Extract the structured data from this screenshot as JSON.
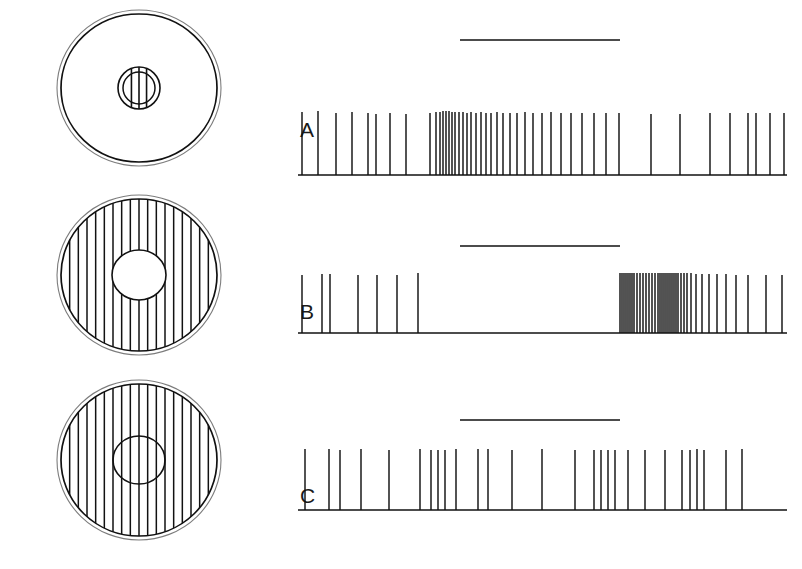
{
  "figure": {
    "background_color": "#ffffff",
    "ink_color": "#111111",
    "width": 802,
    "height": 569
  },
  "rows": [
    {
      "label": "A",
      "label_x": 300,
      "label_y": 118,
      "stimulus": {
        "name": "center-grating-only",
        "description": "Large blank outer circle with small concentric inner disc filled with vertical grating bars",
        "outer_circle": {
          "cx": 105,
          "cy": 88,
          "rx": 78,
          "ry": 74,
          "filled_with_grating": false
        },
        "annulus_ring": {
          "cx": 105,
          "cy": 88,
          "rx": 82,
          "ry": 78,
          "present": true
        },
        "inner_circle": {
          "cx": 105,
          "cy": 88,
          "rx": 21,
          "ry": 21,
          "filled_with_grating": true
        },
        "inner_ring": {
          "cx": 105,
          "cy": 88,
          "rx": 16,
          "ry": 16,
          "present": true
        },
        "grating_orientation": "vertical",
        "inner_bar_count": 3
      },
      "trace": {
        "name": "spike-train-a",
        "response_type": "excitation",
        "baseline_y": 155,
        "axis_x_start": 8,
        "axis_x_end": 497,
        "stimulus_bar": {
          "x_start": 170,
          "x_end": 330,
          "y": 20
        },
        "spike_height_default": 62,
        "spikes": [
          {
            "x": 12,
            "h": 63
          },
          {
            "x": 28,
            "h": 64
          },
          {
            "x": 46,
            "h": 62
          },
          {
            "x": 62,
            "h": 63
          },
          {
            "x": 78,
            "h": 62
          },
          {
            "x": 86,
            "h": 61
          },
          {
            "x": 100,
            "h": 62
          },
          {
            "x": 116,
            "h": 61
          },
          {
            "x": 140,
            "h": 62
          },
          {
            "x": 146,
            "h": 63
          },
          {
            "x": 150,
            "h": 63
          },
          {
            "x": 153,
            "h": 64
          },
          {
            "x": 156,
            "h": 64
          },
          {
            "x": 159,
            "h": 64
          },
          {
            "x": 162,
            "h": 63
          },
          {
            "x": 165,
            "h": 63
          },
          {
            "x": 169,
            "h": 63
          },
          {
            "x": 173,
            "h": 63
          },
          {
            "x": 177,
            "h": 62
          },
          {
            "x": 181,
            "h": 63
          },
          {
            "x": 186,
            "h": 62
          },
          {
            "x": 191,
            "h": 63
          },
          {
            "x": 196,
            "h": 62
          },
          {
            "x": 201,
            "h": 62
          },
          {
            "x": 207,
            "h": 63
          },
          {
            "x": 213,
            "h": 62
          },
          {
            "x": 220,
            "h": 62
          },
          {
            "x": 227,
            "h": 62
          },
          {
            "x": 235,
            "h": 63
          },
          {
            "x": 243,
            "h": 62
          },
          {
            "x": 252,
            "h": 62
          },
          {
            "x": 261,
            "h": 63
          },
          {
            "x": 271,
            "h": 62
          },
          {
            "x": 281,
            "h": 62
          },
          {
            "x": 292,
            "h": 62
          },
          {
            "x": 304,
            "h": 62
          },
          {
            "x": 316,
            "h": 62
          },
          {
            "x": 329,
            "h": 62
          },
          {
            "x": 361,
            "h": 61
          },
          {
            "x": 390,
            "h": 61
          },
          {
            "x": 420,
            "h": 62
          },
          {
            "x": 440,
            "h": 62
          },
          {
            "x": 458,
            "h": 62
          },
          {
            "x": 466,
            "h": 62
          },
          {
            "x": 480,
            "h": 62
          },
          {
            "x": 494,
            "h": 62
          }
        ]
      }
    },
    {
      "label": "B",
      "label_x": 300,
      "label_y": 300,
      "stimulus": {
        "name": "surround-grating-blank-center",
        "description": "Large circle filled with vertical grating bars, blank (unfilled) inner disc",
        "outer_circle": {
          "cx": 105,
          "cy": 90,
          "rx": 78,
          "ry": 76,
          "filled_with_grating": true
        },
        "annulus_ring": {
          "cx": 105,
          "cy": 90,
          "rx": 82,
          "ry": 80,
          "present": true
        },
        "inner_circle": {
          "cx": 105,
          "cy": 90,
          "rx": 27,
          "ry": 25,
          "filled_with_grating": false
        },
        "inner_ring": {
          "cx": 105,
          "cy": 90,
          "rx": 27,
          "ry": 25,
          "present": true
        },
        "grating_orientation": "vertical",
        "outer_bar_count": 17
      },
      "trace": {
        "name": "spike-train-b",
        "response_type": "suppression-with-offset-rebound",
        "baseline_y": 105,
        "axis_x_start": 8,
        "axis_x_end": 497,
        "stimulus_bar": {
          "x_start": 170,
          "x_end": 330,
          "y": 18
        },
        "spike_height_default": 58,
        "spikes": [
          {
            "x": 12,
            "h": 58
          },
          {
            "x": 32,
            "h": 59
          },
          {
            "x": 40,
            "h": 59
          },
          {
            "x": 68,
            "h": 58
          },
          {
            "x": 87,
            "h": 58
          },
          {
            "x": 107,
            "h": 58
          },
          {
            "x": 128,
            "h": 60
          },
          {
            "x": 330,
            "h": 60
          },
          {
            "x": 332,
            "h": 60
          },
          {
            "x": 334,
            "h": 60
          },
          {
            "x": 336,
            "h": 60
          },
          {
            "x": 338,
            "h": 60
          },
          {
            "x": 340,
            "h": 60
          },
          {
            "x": 342,
            "h": 60
          },
          {
            "x": 344,
            "h": 60
          },
          {
            "x": 347,
            "h": 60
          },
          {
            "x": 350,
            "h": 60
          },
          {
            "x": 353,
            "h": 60
          },
          {
            "x": 356,
            "h": 60
          },
          {
            "x": 359,
            "h": 60
          },
          {
            "x": 362,
            "h": 60
          },
          {
            "x": 365,
            "h": 60
          },
          {
            "x": 368,
            "h": 60
          },
          {
            "x": 370,
            "h": 60
          },
          {
            "x": 372,
            "h": 60
          },
          {
            "x": 374,
            "h": 60
          },
          {
            "x": 376,
            "h": 60
          },
          {
            "x": 378,
            "h": 60
          },
          {
            "x": 380,
            "h": 60
          },
          {
            "x": 382,
            "h": 60
          },
          {
            "x": 384,
            "h": 60
          },
          {
            "x": 386,
            "h": 60
          },
          {
            "x": 388,
            "h": 60
          },
          {
            "x": 391,
            "h": 60
          },
          {
            "x": 394,
            "h": 60
          },
          {
            "x": 397,
            "h": 60
          },
          {
            "x": 401,
            "h": 60
          },
          {
            "x": 406,
            "h": 59
          },
          {
            "x": 412,
            "h": 59
          },
          {
            "x": 419,
            "h": 59
          },
          {
            "x": 427,
            "h": 59
          },
          {
            "x": 436,
            "h": 59
          },
          {
            "x": 446,
            "h": 58
          },
          {
            "x": 458,
            "h": 58
          },
          {
            "x": 476,
            "h": 58
          },
          {
            "x": 492,
            "h": 58
          }
        ]
      }
    },
    {
      "label": "C",
      "label_x": 300,
      "label_y": 484,
      "stimulus": {
        "name": "full-field-grating",
        "description": "Large circle filled with vertical grating bars continuing through the outlined inner disc",
        "outer_circle": {
          "cx": 105,
          "cy": 88,
          "rx": 78,
          "ry": 76,
          "filled_with_grating": true
        },
        "annulus_ring": {
          "cx": 105,
          "cy": 88,
          "rx": 82,
          "ry": 80,
          "present": true
        },
        "inner_circle": {
          "cx": 105,
          "cy": 88,
          "rx": 26,
          "ry": 24,
          "filled_with_grating": true
        },
        "inner_ring": {
          "cx": 105,
          "cy": 88,
          "rx": 26,
          "ry": 24,
          "present": true
        },
        "grating_orientation": "vertical",
        "outer_bar_count": 17
      },
      "trace": {
        "name": "spike-train-c",
        "response_type": "minimal-modulation",
        "baseline_y": 110,
        "axis_x_start": 8,
        "axis_x_end": 497,
        "stimulus_bar": {
          "x_start": 170,
          "x_end": 330,
          "y": 20
        },
        "spike_height_default": 60,
        "spikes": [
          {
            "x": 15,
            "h": 61
          },
          {
            "x": 39,
            "h": 61
          },
          {
            "x": 50,
            "h": 60
          },
          {
            "x": 71,
            "h": 61
          },
          {
            "x": 99,
            "h": 60
          },
          {
            "x": 130,
            "h": 61
          },
          {
            "x": 141,
            "h": 60
          },
          {
            "x": 148,
            "h": 60
          },
          {
            "x": 155,
            "h": 60
          },
          {
            "x": 166,
            "h": 61
          },
          {
            "x": 188,
            "h": 61
          },
          {
            "x": 198,
            "h": 61
          },
          {
            "x": 222,
            "h": 60
          },
          {
            "x": 252,
            "h": 61
          },
          {
            "x": 285,
            "h": 60
          },
          {
            "x": 304,
            "h": 60
          },
          {
            "x": 311,
            "h": 60
          },
          {
            "x": 318,
            "h": 60
          },
          {
            "x": 325,
            "h": 60
          },
          {
            "x": 338,
            "h": 60
          },
          {
            "x": 355,
            "h": 60
          },
          {
            "x": 375,
            "h": 60
          },
          {
            "x": 392,
            "h": 60
          },
          {
            "x": 400,
            "h": 60
          },
          {
            "x": 407,
            "h": 61
          },
          {
            "x": 414,
            "h": 60
          },
          {
            "x": 436,
            "h": 60
          },
          {
            "x": 452,
            "h": 61
          }
        ]
      }
    }
  ]
}
